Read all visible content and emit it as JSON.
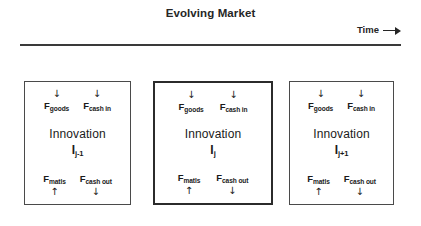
{
  "header": {
    "title": "Evolving Market",
    "axis_label": "Time",
    "axis_arrow_icon": "right-arrow-icon"
  },
  "flow_labels": {
    "goods_symbol": "F",
    "goods_subscript": "goods",
    "cash_in_symbol": "F",
    "cash_in_subscript": "cash in",
    "matls_symbol": "F",
    "matls_subscript": "matls",
    "cash_out_symbol": "F",
    "cash_out_subscript": "cash out"
  },
  "arrows": {
    "down": "↓",
    "up": "↑"
  },
  "boxes": [
    {
      "id": "prev",
      "core_word": "Innovation",
      "index_symbol": "I",
      "index_subscript": "j-1",
      "emphasis": false
    },
    {
      "id": "curr",
      "core_word": "Innovation",
      "index_symbol": "I",
      "index_subscript": "j",
      "emphasis": true
    },
    {
      "id": "next",
      "core_word": "Innovation",
      "index_symbol": "I",
      "index_subscript": "j+1",
      "emphasis": false
    }
  ],
  "colors": {
    "ink": "#1a1a1a",
    "border": "#4a4a4a",
    "border_emphasis": "#2b2b2b",
    "axis": "#3a3a3a",
    "background": "#ffffff"
  }
}
